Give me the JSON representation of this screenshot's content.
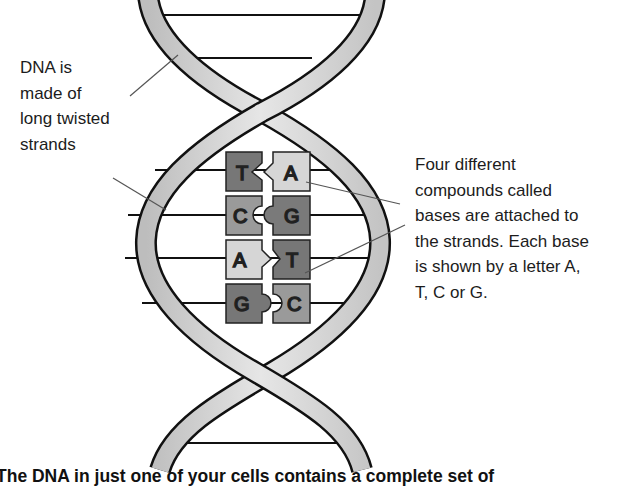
{
  "diagram": {
    "labels": {
      "left": {
        "lines": [
          "DNA is",
          "made of",
          "long twisted",
          "strands"
        ]
      },
      "right": {
        "lines": [
          "Four different",
          "compounds called",
          "bases are attached to",
          "the strands. Each base",
          "is shown by a letter A,",
          "T, C or G."
        ]
      }
    },
    "base_pairs": [
      {
        "left": "T",
        "right": "A",
        "left_color": "#777777",
        "right_color": "#d6d6d6"
      },
      {
        "left": "C",
        "right": "G",
        "left_color": "#9a9a9a",
        "right_color": "#7a7a7a"
      },
      {
        "left": "A",
        "right": "T",
        "left_color": "#d6d6d6",
        "right_color": "#777777"
      },
      {
        "left": "G",
        "right": "C",
        "left_color": "#777777",
        "right_color": "#9a9a9a"
      }
    ],
    "caption": "The DNA in just one of your cells contains a complete set of",
    "colors": {
      "strand_fill": "#d9d9d9",
      "strand_outline": "#111111",
      "rung": "#111111",
      "leader_line": "#555555"
    }
  }
}
